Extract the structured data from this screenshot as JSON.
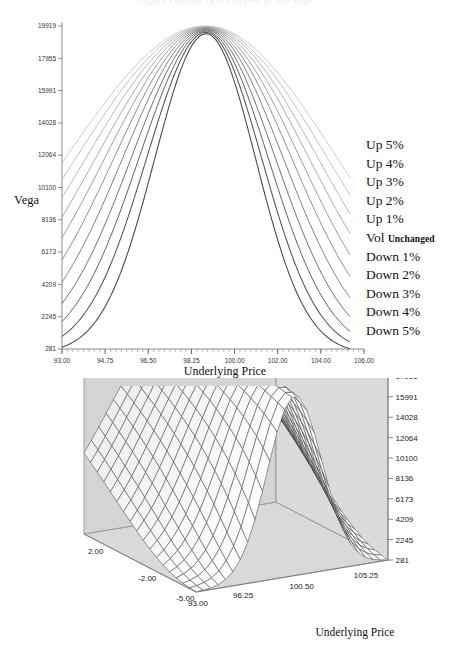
{
  "chart_data": [
    {
      "id": "vega-2d",
      "type": "line",
      "title": "",
      "xlabel": "Underlying Price",
      "ylabel": "Vega",
      "xlim": [
        93.0,
        107.0
      ],
      "ylim": [
        281,
        19919
      ],
      "xticks": [
        "93.00",
        "94.75",
        "96.50",
        "98.25",
        "100.00",
        "102.00",
        "104.00",
        "106.00"
      ],
      "xtick_values": [
        93.0,
        94.75,
        96.5,
        98.25,
        100.0,
        102.0,
        104.0,
        106.0
      ],
      "yticks": [
        "19919",
        "17955",
        "15991",
        "14028",
        "12064",
        "10100",
        "8136",
        "6173",
        "4209",
        "2245",
        "281"
      ],
      "ytick_values": [
        19919,
        17955,
        15991,
        14028,
        12064,
        10100,
        8136,
        6173,
        4209,
        2245,
        281
      ],
      "grid": false,
      "legend_position": "right",
      "series": [
        {
          "name": "Up 5%",
          "shade": "#b9b9b9",
          "peak": 19919,
          "edge_left": 11600,
          "edge_right": 10700
        },
        {
          "name": "Up 4%",
          "shade": "#b0b0b0",
          "peak": 19890,
          "edge_left": 10600,
          "edge_right": 9650
        },
        {
          "name": "Up 3%",
          "shade": "#a5a5a5",
          "peak": 19860,
          "edge_left": 9500,
          "edge_right": 8500
        },
        {
          "name": "Up 2%",
          "shade": "#999999",
          "peak": 19830,
          "edge_left": 8300,
          "edge_right": 7300
        },
        {
          "name": "Up 1%",
          "shade": "#8d8d8d",
          "peak": 19800,
          "edge_left": 7050,
          "edge_right": 6000
        },
        {
          "name": "Vol Unchanged",
          "name_main": "Vol",
          "name_sub": "Unchanged",
          "shade": "#818181",
          "peak": 19760,
          "edge_left": 5700,
          "edge_right": 4700
        },
        {
          "name": "Down 1%",
          "shade": "#757575",
          "peak": 19720,
          "edge_left": 4350,
          "edge_right": 3400
        },
        {
          "name": "Down 2%",
          "shade": "#696969",
          "peak": 19670,
          "edge_left": 3050,
          "edge_right": 2250
        },
        {
          "name": "Down 3%",
          "shade": "#5d5d5d",
          "peak": 19610,
          "edge_left": 1950,
          "edge_right": 1350
        },
        {
          "name": "Down 4%",
          "shade": "#515151",
          "peak": 19540,
          "edge_left": 1050,
          "edge_right": 700
        },
        {
          "name": "Down 5%",
          "shade": "#454545",
          "peak": 19450,
          "edge_left": 390,
          "edge_right": 300
        }
      ]
    },
    {
      "id": "vega-3d",
      "type": "surface",
      "title": "",
      "xlabel": "Underlying Price",
      "zlabel": "",
      "xticks": [
        "93.00",
        "96.25",
        "100.50",
        "105.25"
      ],
      "depth_ticks": [
        "2.00",
        "-2.00",
        "-5.00"
      ],
      "zticks": [
        "19919",
        "17955",
        "15991",
        "14028",
        "12064",
        "10100",
        "8136",
        "6173",
        "4209",
        "2245",
        "281"
      ],
      "ztick_values": [
        19919,
        17955,
        15991,
        14028,
        12064,
        10100,
        8136,
        6173,
        4209,
        2245,
        281
      ],
      "panel_color": "#d6d6d6",
      "mesh_color": "#4a4a4a",
      "surface_color": "#fdfdfd"
    }
  ],
  "chart2d": {
    "ylabel": "Vega",
    "xlabel": "Underlying Price"
  },
  "chart3d": {
    "xlabel": "Underlying Price"
  },
  "legend": {
    "items": [
      {
        "label": "Up 5%"
      },
      {
        "label": "Up 4%"
      },
      {
        "label": "Up 3%"
      },
      {
        "label": "Up 2%"
      },
      {
        "label": "Up 1%"
      },
      {
        "label": "Vol ",
        "sub": "Unchanged"
      },
      {
        "label": "Down 1%"
      },
      {
        "label": "Down 2%"
      },
      {
        "label": "Down 3%"
      },
      {
        "label": "Down 4%"
      },
      {
        "label": "Down 5%"
      }
    ]
  },
  "top_strip": {
    "text": "Figure caption text clipped at top edge"
  }
}
